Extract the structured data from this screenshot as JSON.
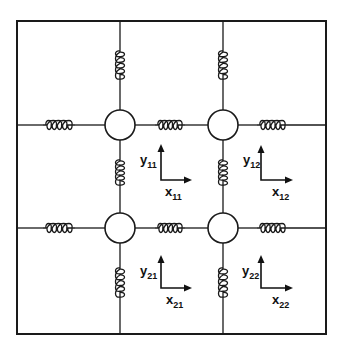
{
  "diagram": {
    "colors": {
      "line": "#1a1a1a",
      "background": "#ffffff"
    },
    "frame": {
      "x1": 17,
      "y1": 21,
      "x2": 326,
      "y2": 334
    },
    "grid_lines": {
      "vertical_x": [
        120,
        223
      ],
      "horizontal_y": [
        125,
        228
      ]
    },
    "masses": [
      {
        "id": "11",
        "cx": 120,
        "cy": 125,
        "r": 15
      },
      {
        "id": "12",
        "cx": 223,
        "cy": 125,
        "r": 15
      },
      {
        "id": "21",
        "cx": 120,
        "cy": 228,
        "r": 15
      },
      {
        "id": "22",
        "cx": 223,
        "cy": 228,
        "r": 15
      }
    ],
    "springs": [
      {
        "id": "top-11",
        "orientation": "vertical",
        "x": 120,
        "y1": 48,
        "y2": 82
      },
      {
        "id": "top-12",
        "orientation": "vertical",
        "x": 223,
        "y1": 48,
        "y2": 82
      },
      {
        "id": "mid-11-21",
        "orientation": "vertical",
        "x": 120,
        "y1": 157,
        "y2": 188
      },
      {
        "id": "mid-12-22",
        "orientation": "vertical",
        "x": 223,
        "y1": 157,
        "y2": 188
      },
      {
        "id": "bottom-21",
        "orientation": "vertical",
        "x": 120,
        "y1": 265,
        "y2": 300
      },
      {
        "id": "bottom-22",
        "orientation": "vertical",
        "x": 223,
        "y1": 265,
        "y2": 300
      },
      {
        "id": "left-11",
        "orientation": "horizontal",
        "y": 125,
        "x1": 43,
        "x2": 75
      },
      {
        "id": "mid-11-12",
        "orientation": "horizontal",
        "y": 125,
        "x1": 155,
        "x2": 185
      },
      {
        "id": "right-12",
        "orientation": "horizontal",
        "y": 125,
        "x1": 257,
        "x2": 288
      },
      {
        "id": "left-21",
        "orientation": "horizontal",
        "y": 228,
        "x1": 43,
        "x2": 75
      },
      {
        "id": "mid-21-22",
        "orientation": "horizontal",
        "y": 228,
        "x1": 155,
        "x2": 185
      },
      {
        "id": "right-22",
        "orientation": "horizontal",
        "y": 228,
        "x1": 257,
        "x2": 288
      }
    ],
    "axes": [
      {
        "id": "11",
        "ox": 161,
        "oy": 180,
        "ytip": 145,
        "xtip": 191,
        "y_label": "y",
        "y_sub": "11",
        "x_label": "x",
        "x_sub": "11"
      },
      {
        "id": "12",
        "ox": 261,
        "oy": 180,
        "ytip": 146,
        "xtip": 292,
        "y_label": "y",
        "y_sub": "12",
        "x_label": "x",
        "x_sub": "12"
      },
      {
        "id": "21",
        "ox": 161,
        "oy": 288,
        "ytip": 256,
        "xtip": 191,
        "y_label": "y",
        "y_sub": "21",
        "x_label": "x",
        "x_sub": "21"
      },
      {
        "id": "22",
        "ox": 261,
        "oy": 288,
        "ytip": 256,
        "xtip": 292,
        "y_label": "y",
        "y_sub": "22",
        "x_label": "x",
        "x_sub": "22"
      }
    ]
  }
}
